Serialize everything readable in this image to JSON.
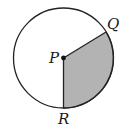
{
  "diagram": {
    "type": "circle-sector",
    "circle": {
      "cx": 63.5,
      "cy": 58,
      "r": 50,
      "stroke": "#222222",
      "fill": "#ffffff"
    },
    "center_point": {
      "label": "P",
      "x": 63.5,
      "y": 58
    },
    "points": [
      {
        "label": "Q",
        "x": 106,
        "y": 32
      },
      {
        "label": "R",
        "x": 63.5,
        "y": 108
      }
    ],
    "sector": {
      "from": "R",
      "to": "Q",
      "shade": "#b3b3b3",
      "description": "shaded sector bounded by radii PR and PQ"
    },
    "labels": {
      "P": "P",
      "Q": "Q",
      "R": "R"
    }
  }
}
